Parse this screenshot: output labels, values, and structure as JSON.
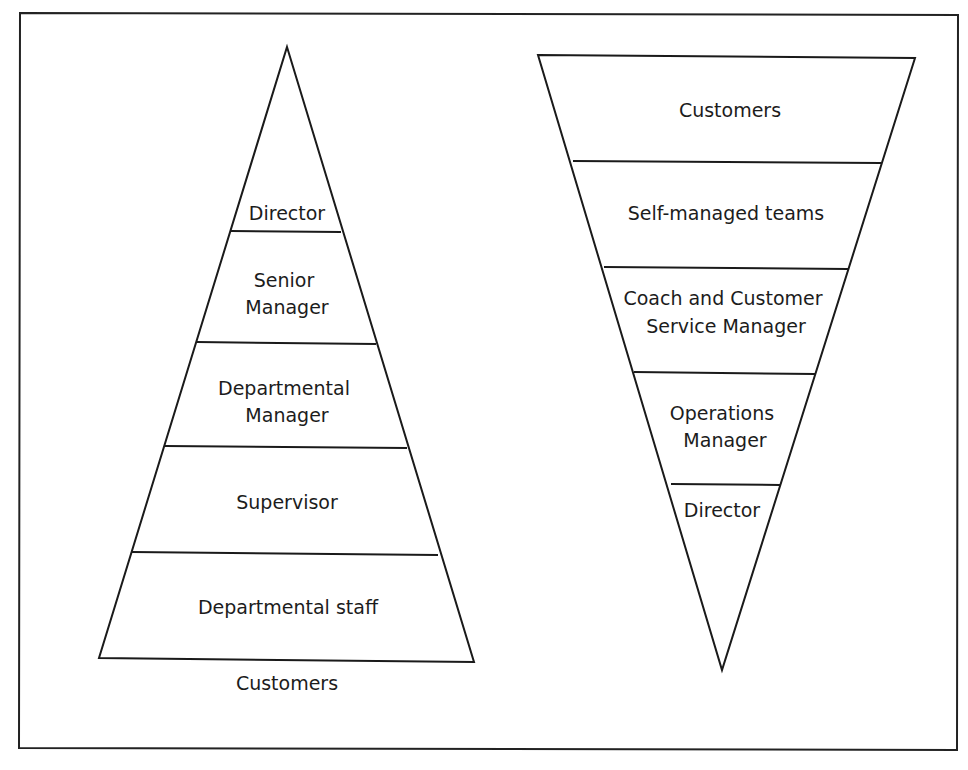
{
  "diagram": {
    "type": "organisational-structure-comparison",
    "left": {
      "name": "traditional-pyramid",
      "orientation": "upright",
      "tiers_top_to_bottom": [
        {
          "lines": [
            "Director"
          ]
        },
        {
          "lines": [
            "Senior",
            "Manager"
          ]
        },
        {
          "lines": [
            "Departmental",
            "Manager"
          ]
        },
        {
          "lines": [
            "Supervisor"
          ]
        },
        {
          "lines": [
            "Departmental staff"
          ]
        }
      ],
      "below_label": "Customers"
    },
    "right": {
      "name": "inverted-pyramid",
      "orientation": "inverted",
      "tiers_top_to_bottom": [
        {
          "lines": [
            "Customers"
          ]
        },
        {
          "lines": [
            "Self-managed teams"
          ]
        },
        {
          "lines": [
            "Coach and Customer",
            "Service Manager"
          ]
        },
        {
          "lines": [
            "Operations",
            "Manager"
          ]
        },
        {
          "lines": [
            "Director"
          ]
        }
      ]
    },
    "colors": {
      "line": "#1a1a1a",
      "text": "#1c1c1c",
      "background": "#ffffff"
    }
  }
}
